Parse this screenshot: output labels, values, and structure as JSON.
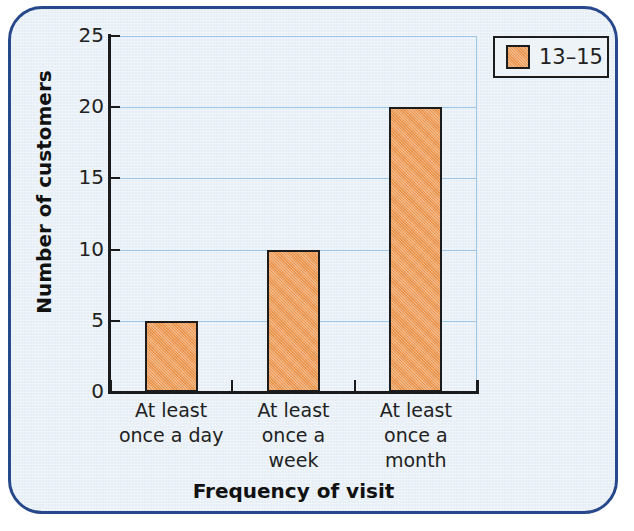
{
  "chart_data": {
    "type": "bar",
    "title": "",
    "categories": [
      "At least once a day",
      "At least once a week",
      "At least once a month"
    ],
    "category_lines": [
      [
        "At least",
        "once a day"
      ],
      [
        "At least",
        "once a",
        "week"
      ],
      [
        "At least",
        "once a",
        "month"
      ]
    ],
    "values": [
      5,
      10,
      20
    ],
    "series": [
      {
        "name": "13–15",
        "values": [
          5,
          10,
          20
        ]
      }
    ],
    "xlabel": "Frequency of visit",
    "ylabel": "Number of customers",
    "ylim": [
      0,
      25
    ],
    "yticks": [
      0,
      5,
      10,
      15,
      20,
      25
    ],
    "ytick_labels": [
      "0",
      "5",
      "10",
      "15",
      "20",
      "25"
    ],
    "grid": true,
    "grid_axis": "y",
    "legend": {
      "position": "top-right",
      "entries": [
        {
          "label": "13–15",
          "color": "#ef9b54"
        }
      ]
    },
    "colors": {
      "bar_fill": "#ef9b54",
      "bar_edge": "#1c1c1c",
      "gridline": "#9fc8e8",
      "axis": "#1b1b1b",
      "panel_background": "#e7eff6",
      "panel_border": "#28488c",
      "text": "#222222"
    }
  }
}
